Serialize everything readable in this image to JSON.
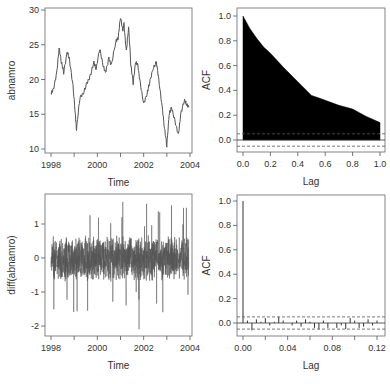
{
  "chart_data": [
    {
      "id": "series",
      "type": "line",
      "title": "",
      "xlabel": "Time",
      "ylabel": "abnamro",
      "xlim": [
        1998,
        2004
      ],
      "ylim": [
        10,
        30
      ],
      "xticks": [
        "1998",
        "2000",
        "2002",
        "2004"
      ],
      "yticks": [
        "10",
        "15",
        "20",
        "25",
        "30"
      ],
      "grid": false,
      "x": [
        1998.0,
        1998.1,
        1998.25,
        1998.35,
        1998.45,
        1998.55,
        1998.7,
        1998.8,
        1998.95,
        1999.05,
        1999.1,
        1999.25,
        1999.4,
        1999.55,
        1999.7,
        1999.85,
        1999.95,
        2000.1,
        2000.25,
        2000.35,
        2000.5,
        2000.6,
        2000.8,
        2000.9,
        2001.0,
        2001.1,
        2001.15,
        2001.25,
        2001.35,
        2001.45,
        2001.55,
        2001.65,
        2001.75,
        2001.85,
        2002.0,
        2002.15,
        2002.25,
        2002.4,
        2002.55,
        2002.65,
        2002.8,
        2002.9,
        2003.0,
        2003.1,
        2003.2,
        2003.35,
        2003.5,
        2003.6,
        2003.75,
        2003.85,
        2003.95
      ],
      "values": [
        18,
        18.5,
        21,
        24.5,
        22.5,
        21,
        24,
        22.8,
        19,
        15,
        12.8,
        17.5,
        18,
        19.5,
        20.5,
        22.5,
        21.5,
        24.5,
        22,
        21,
        23,
        22,
        25.5,
        26,
        29,
        27,
        28,
        24,
        27.5,
        22,
        19.5,
        22.5,
        22,
        19.5,
        16.5,
        18,
        19.5,
        21.5,
        22.5,
        20,
        16,
        13,
        10.5,
        15,
        16,
        14,
        12,
        15,
        17,
        16.5,
        16
      ]
    },
    {
      "id": "acf-series",
      "type": "area",
      "title": "",
      "xlabel": "Lag",
      "ylabel": "ACF",
      "xlim": [
        0,
        1
      ],
      "ylim": [
        -0.1,
        1.0
      ],
      "xticks": [
        "0.0",
        "0.2",
        "0.4",
        "0.6",
        "0.8",
        "1.0"
      ],
      "yticks": [
        "0.0",
        "0.2",
        "0.4",
        "0.6",
        "0.8",
        "1.0"
      ],
      "confidence_band": [
        -0.05,
        0.05
      ],
      "x": [
        0.0,
        0.05,
        0.1,
        0.15,
        0.2,
        0.3,
        0.4,
        0.5,
        0.55,
        0.6,
        0.7,
        0.8,
        0.85,
        0.9,
        1.0
      ],
      "values": [
        1.0,
        0.9,
        0.82,
        0.75,
        0.7,
        0.58,
        0.47,
        0.36,
        0.34,
        0.32,
        0.28,
        0.25,
        0.22,
        0.19,
        0.14
      ]
    },
    {
      "id": "diff-series",
      "type": "line",
      "title": "",
      "xlabel": "Time",
      "ylabel": "diff(abnamro)",
      "xlim": [
        1998,
        2004
      ],
      "ylim": [
        -2.2,
        1.7
      ],
      "xticks": [
        "1998",
        "2000",
        "2002",
        "2004"
      ],
      "yticks": [
        "-2",
        "-1",
        "0",
        "1"
      ],
      "notable_extremes": {
        "max": 1.65,
        "min": -2.1,
        "min_at": 2001.8
      }
    },
    {
      "id": "acf-diff",
      "type": "bar",
      "title": "",
      "xlabel": "Lag",
      "ylabel": "ACF",
      "xlim": [
        0,
        0.12
      ],
      "ylim": [
        -0.1,
        1.0
      ],
      "xticks": [
        "0.00",
        "0.04",
        "0.08",
        "0.12"
      ],
      "yticks": [
        "0.0",
        "0.2",
        "0.4",
        "0.6",
        "0.8",
        "1.0"
      ],
      "confidence_band": [
        -0.05,
        0.05
      ],
      "x": [
        0.0,
        0.004,
        0.008,
        0.012,
        0.016,
        0.02,
        0.024,
        0.028,
        0.032,
        0.036,
        0.04,
        0.044,
        0.048,
        0.052,
        0.056,
        0.06,
        0.064,
        0.068,
        0.072,
        0.076,
        0.08,
        0.084,
        0.088,
        0.092,
        0.096,
        0.1,
        0.104,
        0.108,
        0.112,
        0.116,
        0.12
      ],
      "values": [
        1.0,
        0.02,
        -0.06,
        0.03,
        0.01,
        0.04,
        -0.02,
        0.01,
        0.05,
        0.02,
        0.0,
        -0.02,
        0.02,
        -0.03,
        0.03,
        0.01,
        -0.04,
        -0.05,
        0.02,
        -0.04,
        0.0,
        -0.04,
        -0.02,
        -0.05,
        0.04,
        0.02,
        -0.04,
        -0.03,
        0.03,
        -0.02,
        0.02
      ]
    }
  ]
}
